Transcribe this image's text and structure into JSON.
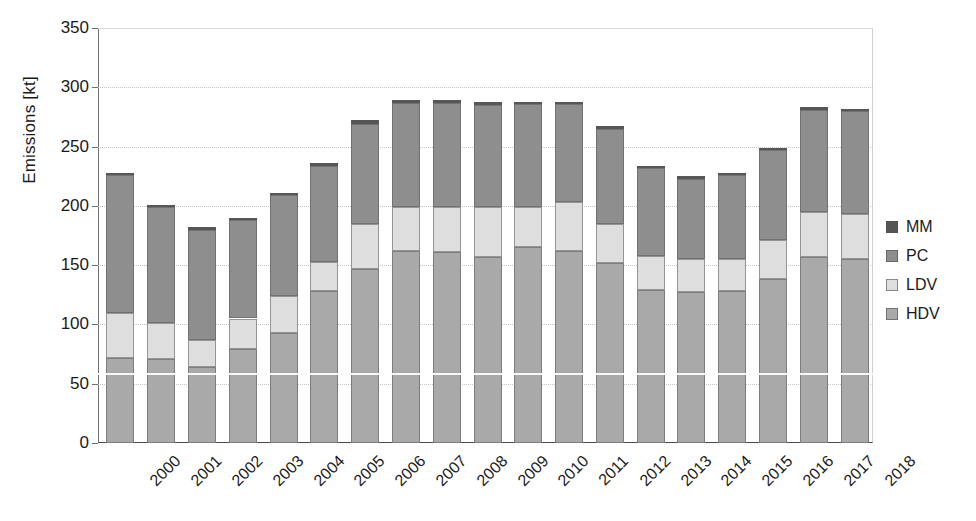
{
  "chart_data": {
    "type": "bar",
    "stacked": true,
    "title": "",
    "xlabel": "",
    "ylabel": "Emissions [kt]",
    "ylim": [
      0,
      350
    ],
    "yticks": [
      0,
      50,
      100,
      150,
      200,
      250,
      300,
      350
    ],
    "ytick_labels": [
      "0",
      "50",
      "100",
      "150",
      "200",
      "250",
      "300",
      "350"
    ],
    "grid": "horizontal-dotted",
    "legend_position": "right",
    "categories": [
      "2000",
      "2001",
      "2002",
      "2003",
      "2004",
      "2005",
      "2006",
      "2007",
      "2008",
      "2009",
      "2010",
      "2011",
      "2012",
      "2013",
      "2014",
      "2015",
      "2016",
      "2017",
      "2018"
    ],
    "series": [
      {
        "name": "HDV",
        "color": "#a9a9a9",
        "values": [
          72,
          71,
          64,
          79,
          93,
          128,
          147,
          162,
          161,
          157,
          165,
          162,
          152,
          129,
          127,
          128,
          138,
          157,
          155
        ]
      },
      {
        "name": "LDV",
        "color": "#dedede",
        "values": [
          38,
          30,
          23,
          26,
          31,
          25,
          38,
          37,
          38,
          42,
          34,
          41,
          33,
          29,
          28,
          27,
          33,
          38,
          38
        ]
      },
      {
        "name": "PC",
        "color": "#8e8e8e",
        "values": [
          116,
          98,
          93,
          83,
          85,
          81,
          84,
          88,
          88,
          86,
          87,
          83,
          80,
          74,
          68,
          71,
          76,
          86,
          87
        ]
      },
      {
        "name": "MM",
        "color": "#555555",
        "values": [
          2,
          2,
          2,
          2,
          2,
          2,
          3,
          2,
          2,
          3,
          2,
          2,
          2,
          2,
          2,
          2,
          2,
          2,
          2
        ]
      }
    ],
    "totals": [
      228,
      201,
      182,
      190,
      211,
      236,
      272,
      289,
      289,
      288,
      288,
      288,
      267,
      234,
      225,
      228,
      249,
      283,
      282
    ]
  },
  "legend": {
    "entries": [
      {
        "label": "MM",
        "color": "#555555"
      },
      {
        "label": "PC",
        "color": "#8e8e8e"
      },
      {
        "label": "LDV",
        "color": "#dedede"
      },
      {
        "label": "HDV",
        "color": "#a9a9a9"
      }
    ]
  }
}
